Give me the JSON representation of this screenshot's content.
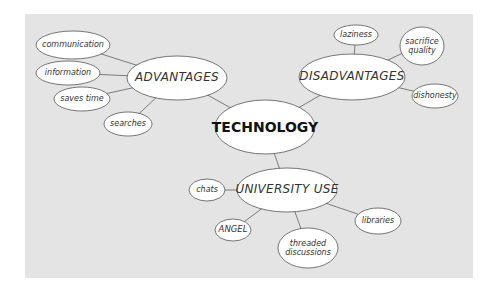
{
  "diagram": {
    "type": "mind-map",
    "colors": {
      "background": "#ffffff",
      "panel": "#e4e4e4",
      "node_fill": "#ffffff",
      "node_stroke": "#555555",
      "edge": "#6e6e6e"
    },
    "root": {
      "label": "TECHNOLOGY"
    },
    "branches": [
      {
        "label": "ADVANTAGES",
        "children": [
          "communication",
          "information",
          "saves time",
          "searches"
        ]
      },
      {
        "label": "DISADVANTAGES",
        "children": [
          "laziness",
          "sacrifice quality",
          "dishonesty"
        ]
      },
      {
        "label": "UNIVERSITY USE",
        "children": [
          "chats",
          "ANGEL",
          "threaded discussions",
          "libraries"
        ]
      }
    ],
    "nodes": {
      "technology": "TECHNOLOGY",
      "advantages": "ADVANTAGES",
      "communication": "communication",
      "information": "information",
      "saves_time": "saves time",
      "searches": "searches",
      "disadvantages": "DISADVANTAGES",
      "laziness": "laziness",
      "sacrifice_quality_1": "sacrifice",
      "sacrifice_quality_2": "quality",
      "dishonesty": "dishonesty",
      "university_use": "UNIVERSITY USE",
      "chats": "chats",
      "angel": "ANGEL",
      "threaded_discussions_1": "threaded",
      "threaded_discussions_2": "discussions",
      "libraries": "libraries"
    }
  }
}
